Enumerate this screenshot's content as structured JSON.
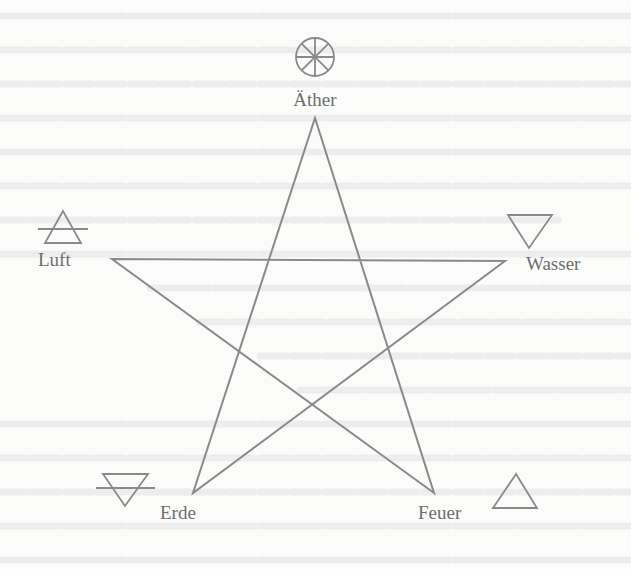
{
  "figure": {
    "type": "pentagram-elements",
    "stroke_color": "#8a8a8a",
    "text_color": "#6e6e6e",
    "background_color": "#fbfbfa",
    "bleed_through_color": "#ececec"
  },
  "elements": [
    {
      "id": "aether",
      "label": "Äther",
      "symbol": "eight-spoked-wheel",
      "position": "top"
    },
    {
      "id": "luft",
      "label": "Luft",
      "symbol": "upward-triangle-with-bar",
      "position": "upper-left"
    },
    {
      "id": "wasser",
      "label": "Wasser",
      "symbol": "downward-triangle",
      "position": "upper-right"
    },
    {
      "id": "erde",
      "label": "Erde",
      "symbol": "downward-triangle-with-bar",
      "position": "lower-left"
    },
    {
      "id": "feuer",
      "label": "Feuer",
      "symbol": "upward-triangle",
      "position": "lower-right"
    }
  ],
  "pentagram": {
    "points": {
      "top": [
        315,
        118
      ],
      "left": [
        112,
        259
      ],
      "right": [
        505,
        261
      ],
      "bottom_left": [
        193,
        493
      ],
      "bottom_right": [
        434,
        493
      ]
    }
  }
}
